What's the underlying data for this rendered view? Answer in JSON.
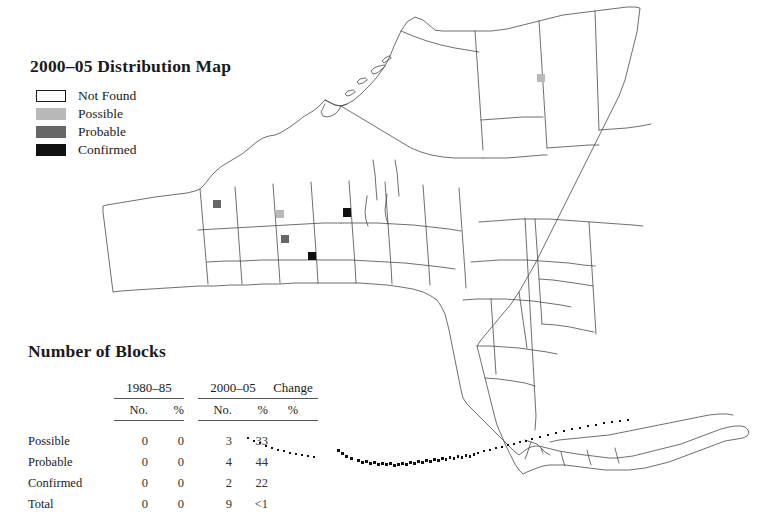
{
  "page": {
    "background": "#ffffff",
    "ink": "#1a1a1a"
  },
  "legend": {
    "title": "2000–05 Distribution Map",
    "items": [
      {
        "label": "Not Found",
        "color": "#ffffff",
        "border": "#1a1a1a"
      },
      {
        "label": "Possible",
        "color": "#b9b9b9",
        "border": "#b9b9b9"
      },
      {
        "label": "Probable",
        "color": "#676767",
        "border": "#676767"
      },
      {
        "label": "Confirmed",
        "color": "#111111",
        "border": "#111111"
      }
    ]
  },
  "table": {
    "title": "Number of Blocks",
    "group_headers": [
      "1980–85",
      "2000–05",
      "Change"
    ],
    "sub_headers": {
      "period1": [
        "No.",
        "%"
      ],
      "period2": [
        "No.",
        "%"
      ],
      "change": [
        "%"
      ]
    },
    "rows": [
      {
        "label": "Possible",
        "p1_no": "0",
        "p1_pct": "0",
        "p2_no": "3",
        "p2_pct": "33",
        "change": ""
      },
      {
        "label": "Probable",
        "p1_no": "0",
        "p1_pct": "0",
        "p2_no": "4",
        "p2_pct": "44",
        "change": ""
      },
      {
        "label": "Confirmed",
        "p1_no": "0",
        "p1_pct": "0",
        "p2_no": "2",
        "p2_pct": "22",
        "change": ""
      },
      {
        "label": "Total",
        "p1_no": "0",
        "p1_pct": "0",
        "p2_no": "9",
        "p2_pct": "<1",
        "change": ""
      }
    ]
  },
  "map": {
    "region_name": "New York State",
    "outline_color": "#4a4a4a",
    "markers": [
      {
        "status": "Probable",
        "x": 213,
        "y": 205,
        "color": "#676767"
      },
      {
        "status": "Possible",
        "x": 276,
        "y": 215,
        "color": "#b9b9b9"
      },
      {
        "status": "Probable",
        "x": 281,
        "y": 240,
        "color": "#676767"
      },
      {
        "status": "Confirmed",
        "x": 308,
        "y": 257,
        "color": "#111111"
      },
      {
        "status": "Confirmed",
        "x": 343,
        "y": 213,
        "color": "#111111"
      },
      {
        "status": "Possible",
        "x": 537,
        "y": 79,
        "color": "#b9b9b9"
      }
    ]
  }
}
